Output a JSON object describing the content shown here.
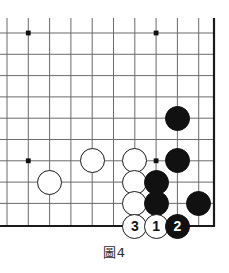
{
  "figure": {
    "kind": "go-board-diagram",
    "caption": "圖4",
    "caption_number": "4",
    "board": {
      "line_color": "#6b6b6b",
      "edge_color": "#1a1a1a",
      "background_color": "#ffffff",
      "star_point_color": "#111111",
      "grid_spacing_px": 21.3,
      "columns_px": [
        7,
        28.3,
        49.6,
        70.9,
        92.2,
        113.5,
        134.8,
        156.1,
        177.4,
        198.7,
        214
      ],
      "rows_px": [
        18,
        33,
        54.3,
        75.6,
        96.9,
        118.2,
        139.5,
        160.8,
        182.1,
        203.4,
        226
      ],
      "right_edge_px": 214,
      "bottom_edge_px": 226,
      "cropped_sides": [
        "top",
        "left"
      ]
    },
    "star_points": [
      {
        "name": "star-point-upper-left",
        "x": 28.3,
        "y": 33
      },
      {
        "name": "star-point-upper-right",
        "x": 156.1,
        "y": 33
      },
      {
        "name": "star-point-left-side",
        "x": 28.3,
        "y": 160.8
      },
      {
        "name": "star-point-lower-right",
        "x": 156.1,
        "y": 160.8
      }
    ],
    "stone_radius_px": 12.5,
    "stones": [
      {
        "id": "white-stone-a",
        "color": "white",
        "label": "",
        "x": 49.6,
        "y": 182.1
      },
      {
        "id": "white-stone-b",
        "color": "white",
        "label": "",
        "x": 92.2,
        "y": 160.8
      },
      {
        "id": "white-stone-c",
        "color": "white",
        "label": "",
        "x": 134.8,
        "y": 160.8
      },
      {
        "id": "white-stone-d",
        "color": "white",
        "label": "",
        "x": 134.8,
        "y": 182.1
      },
      {
        "id": "white-stone-e",
        "color": "white",
        "label": "",
        "x": 134.8,
        "y": 203.4
      },
      {
        "id": "black-stone-a",
        "color": "black",
        "label": "",
        "x": 177.4,
        "y": 118.2
      },
      {
        "id": "black-stone-b",
        "color": "black",
        "label": "",
        "x": 177.4,
        "y": 160.8
      },
      {
        "id": "black-stone-c",
        "color": "black",
        "label": "",
        "x": 156.1,
        "y": 182.1
      },
      {
        "id": "black-stone-d",
        "color": "black",
        "label": "",
        "x": 156.1,
        "y": 203.4
      },
      {
        "id": "black-stone-e",
        "color": "black",
        "label": "",
        "x": 198.7,
        "y": 203.4
      },
      {
        "id": "move-3-white",
        "color": "white",
        "label": "3",
        "x": 134.8,
        "y": 226
      },
      {
        "id": "move-1-white",
        "color": "white",
        "label": "1",
        "x": 156.1,
        "y": 226
      },
      {
        "id": "move-2-black",
        "color": "black",
        "label": "2",
        "x": 177.4,
        "y": 226
      }
    ],
    "move_sequence": [
      {
        "number": "1",
        "color": "white"
      },
      {
        "number": "2",
        "color": "black"
      },
      {
        "number": "3",
        "color": "white"
      }
    ]
  }
}
